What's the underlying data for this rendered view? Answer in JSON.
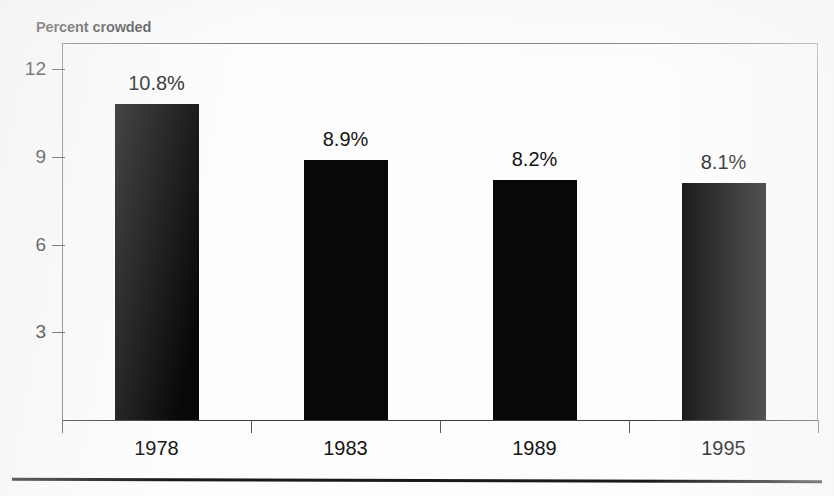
{
  "figure": {
    "axis_title": "Percent crowded",
    "title_fragment": "",
    "background_color": "#fdfdfd",
    "bar_color": "#080808",
    "axis_color": "#3d3d3d"
  },
  "chart_data": {
    "type": "bar",
    "title": "",
    "xlabel": "",
    "ylabel": "Percent crowded",
    "categories": [
      "1978",
      "1983",
      "1989",
      "1995"
    ],
    "values": [
      10.8,
      8.9,
      8.2,
      8.1
    ],
    "value_labels": [
      "10.8%",
      "8.9%",
      "8.2%",
      "8.1%"
    ],
    "ylim": [
      0,
      12.9
    ],
    "yticks": [
      3,
      6,
      9,
      12
    ],
    "ytick_labels": [
      "3",
      "6",
      "9",
      "12"
    ],
    "grid": false,
    "legend": "none",
    "series": [
      {
        "name": "Percent crowded",
        "values": [
          10.8,
          8.9,
          8.2,
          8.1
        ]
      }
    ]
  }
}
